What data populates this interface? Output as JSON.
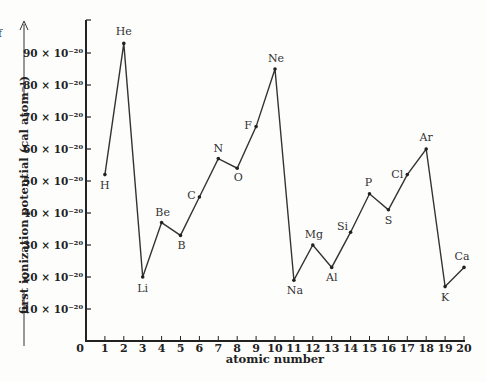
{
  "chart_data": {
    "type": "line",
    "title": "",
    "xlabel": "atomic number",
    "ylabel": "first ionization potential (cal atom⁻¹)",
    "x": [
      1,
      2,
      3,
      4,
      5,
      6,
      7,
      8,
      9,
      10,
      11,
      12,
      13,
      14,
      15,
      16,
      17,
      18,
      19,
      20
    ],
    "x_tick_labels": [
      "0",
      "1",
      "2",
      "3",
      "4",
      "5",
      "6",
      "7",
      "8",
      "9",
      "10",
      "11",
      "12",
      "13",
      "14",
      "15",
      "16",
      "17",
      "18",
      "19",
      "20"
    ],
    "y_tick_labels": [
      "10 × 10⁻²⁰",
      "20 × 10⁻²⁰",
      "30 × 10⁻²⁰",
      "40 × 10⁻²⁰",
      "50 × 10⁻²⁰",
      "60 × 10⁻²⁰",
      "70 × 10⁻²⁰",
      "80 × 10⁻²⁰",
      "90 × 10⁻²⁰"
    ],
    "y_tick_values": [
      10,
      20,
      30,
      40,
      50,
      60,
      70,
      80,
      90
    ],
    "y_unit_multiplier": "10⁻²⁰",
    "xlim": [
      0,
      20
    ],
    "ylim": [
      0,
      100
    ],
    "grid": false,
    "legend": null,
    "series": [
      {
        "name": "first ionization potential",
        "points": [
          {
            "z": 1,
            "label": "H",
            "value": 52,
            "lx": 0,
            "ly": 14
          },
          {
            "z": 2,
            "label": "He",
            "value": 93,
            "lx": 0,
            "ly": -8
          },
          {
            "z": 3,
            "label": "Li",
            "value": 20,
            "lx": 0,
            "ly": 15
          },
          {
            "z": 4,
            "label": "Be",
            "value": 37,
            "lx": 1,
            "ly": -7
          },
          {
            "z": 5,
            "label": "B",
            "value": 33,
            "lx": 1,
            "ly": 14
          },
          {
            "z": 6,
            "label": "C",
            "value": 45,
            "lx": -8,
            "ly": 2
          },
          {
            "z": 7,
            "label": "N",
            "value": 57,
            "lx": 0,
            "ly": -7
          },
          {
            "z": 8,
            "label": "O",
            "value": 54,
            "lx": 1,
            "ly": 13
          },
          {
            "z": 9,
            "label": "F",
            "value": 67,
            "lx": -8,
            "ly": 2
          },
          {
            "z": 10,
            "label": "Ne",
            "value": 85,
            "lx": 1,
            "ly": -7
          },
          {
            "z": 11,
            "label": "Na",
            "value": 19,
            "lx": 1,
            "ly": 14
          },
          {
            "z": 12,
            "label": "Mg",
            "value": 30,
            "lx": 1,
            "ly": -7
          },
          {
            "z": 13,
            "label": "Al",
            "value": 23,
            "lx": 0,
            "ly": 14
          },
          {
            "z": 14,
            "label": "Si",
            "value": 34,
            "lx": -8,
            "ly": -2
          },
          {
            "z": 15,
            "label": "P",
            "value": 46,
            "lx": -1,
            "ly": -8
          },
          {
            "z": 16,
            "label": "S",
            "value": 41,
            "lx": 0,
            "ly": 14
          },
          {
            "z": 17,
            "label": "Cl",
            "value": 52,
            "lx": -10,
            "ly": 3
          },
          {
            "z": 18,
            "label": "Ar",
            "value": 60,
            "lx": 0,
            "ly": -8
          },
          {
            "z": 19,
            "label": "K",
            "value": 17,
            "lx": 0,
            "ly": 14
          },
          {
            "z": 20,
            "label": "Ca",
            "value": 23,
            "lx": -2,
            "ly": -7
          }
        ]
      }
    ]
  },
  "fragment_text": "f"
}
